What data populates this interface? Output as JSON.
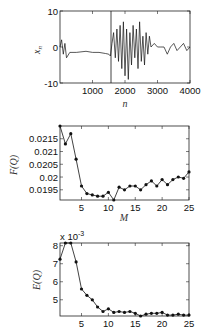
{
  "chart_data": [
    {
      "type": "line",
      "title": "",
      "xlabel": "n",
      "ylabel": "x_n",
      "xlim": [
        0,
        4000
      ],
      "ylim": [
        -10,
        10
      ],
      "xticks": [
        1000,
        2000,
        3000,
        4000
      ],
      "yticks": [
        -10,
        0,
        10
      ],
      "grid": false,
      "annotations": [
        "vertical marker line at n≈1600"
      ],
      "x": [
        0,
        50,
        100,
        150,
        200,
        300,
        500,
        800,
        1000,
        1200,
        1400,
        1500,
        1550,
        1600,
        1650,
        1700,
        1750,
        1800,
        1850,
        1900,
        1950,
        2000,
        2050,
        2100,
        2150,
        2200,
        2250,
        2300,
        2350,
        2400,
        2450,
        2500,
        2550,
        2600,
        2650,
        2700,
        2750,
        2800,
        2900,
        3000,
        3100,
        3200,
        3300,
        3400,
        3500,
        3600,
        3700,
        3800,
        3900,
        4000
      ],
      "values": [
        0,
        2,
        -2,
        1,
        -3,
        -1.5,
        -1.5,
        -1.2,
        -1.5,
        -1.5,
        -1.8,
        -2,
        -2.5,
        1,
        4,
        -3,
        5,
        -4,
        6,
        -6,
        7,
        -8,
        5,
        -9,
        4,
        -5,
        6,
        -3,
        5,
        -6,
        7,
        -4,
        3,
        -5,
        4,
        -2,
        3,
        0,
        1,
        0,
        0,
        0,
        -2,
        0,
        1,
        -1,
        0,
        1,
        -1,
        0
      ]
    },
    {
      "type": "line",
      "title": "",
      "xlabel": "M",
      "ylabel": "F(Q)",
      "xlim": [
        1,
        25
      ],
      "ylim": [
        0.0191,
        0.022
      ],
      "xticks": [
        5,
        10,
        15,
        20,
        25
      ],
      "yticks": [
        0.0195,
        0.02,
        0.0205,
        0.021,
        0.0215
      ],
      "ytick_labels": [
        "0.0195",
        "0.02",
        "0.0205",
        "0.021",
        "0.0215"
      ],
      "grid": false,
      "markers": true,
      "x": [
        1,
        2,
        3,
        4,
        5,
        6,
        7,
        8,
        9,
        10,
        11,
        12,
        13,
        14,
        15,
        16,
        17,
        18,
        19,
        20,
        21,
        22,
        23,
        24,
        25
      ],
      "values": [
        0.022,
        0.0213,
        0.0217,
        0.0207,
        0.01965,
        0.01935,
        0.0193,
        0.01925,
        0.01925,
        0.0194,
        0.0191,
        0.0196,
        0.0195,
        0.01965,
        0.01965,
        0.0195,
        0.0197,
        0.01985,
        0.01965,
        0.0199,
        0.0197,
        0.0199,
        0.02,
        0.01995,
        0.0202
      ]
    },
    {
      "type": "line",
      "title": "",
      "xlabel": "",
      "ylabel": "E(Q)",
      "scale_note": "x 10^-3",
      "xlim": [
        1,
        25
      ],
      "ylim": [
        4.1,
        8.15
      ],
      "xticks": [
        5,
        10,
        15,
        20,
        25
      ],
      "yticks": [
        5,
        6,
        7,
        8
      ],
      "grid": false,
      "markers": true,
      "x": [
        1,
        2,
        3,
        4,
        5,
        6,
        7,
        8,
        9,
        10,
        11,
        12,
        13,
        14,
        15,
        16,
        17,
        18,
        19,
        20,
        21,
        22,
        23,
        24,
        25
      ],
      "values": [
        7.25,
        8.15,
        8.15,
        7.1,
        5.6,
        5.25,
        5.0,
        4.6,
        4.35,
        4.5,
        4.3,
        4.35,
        4.3,
        4.35,
        4.25,
        4.1,
        4.2,
        4.25,
        4.25,
        4.3,
        4.15,
        4.15,
        4.2,
        4.15,
        4.15
      ]
    }
  ],
  "labels": {
    "top_ylabel_main": "x",
    "top_ylabel_sub": "n",
    "top_xlabel": "n",
    "mid_ylabel": "F(Q)",
    "mid_xlabel": "M",
    "bot_ylabel": "E(Q)",
    "bot_scale_x": "x 10",
    "bot_scale_exp": "-3"
  }
}
